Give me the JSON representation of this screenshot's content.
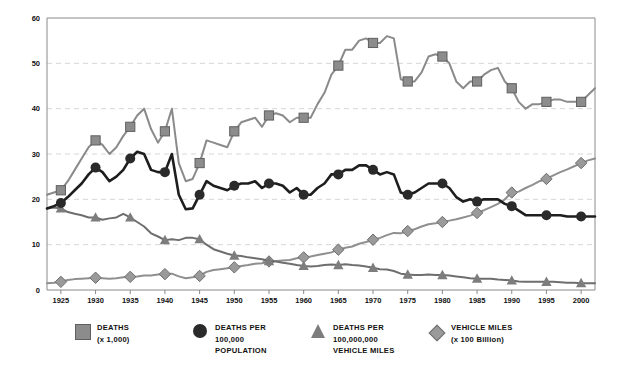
{
  "chart_data": {
    "type": "line",
    "title": "",
    "subtitle": "",
    "xlabel": "",
    "ylabel": "",
    "xlim": [
      1923,
      2002
    ],
    "ylim": [
      0,
      60
    ],
    "yticks": [
      0,
      10,
      20,
      30,
      40,
      50,
      60
    ],
    "xticks": [
      1925,
      1930,
      1935,
      1940,
      1945,
      1950,
      1955,
      1960,
      1965,
      1970,
      1975,
      1980,
      1985,
      1990,
      1995,
      2000
    ],
    "grid": "horizontal-dashed",
    "legend_position": "bottom",
    "x": [
      1923,
      1924,
      1925,
      1926,
      1927,
      1928,
      1929,
      1930,
      1931,
      1932,
      1933,
      1934,
      1935,
      1936,
      1937,
      1938,
      1939,
      1940,
      1941,
      1942,
      1943,
      1944,
      1945,
      1946,
      1947,
      1948,
      1949,
      1950,
      1951,
      1952,
      1953,
      1954,
      1955,
      1956,
      1957,
      1958,
      1959,
      1960,
      1961,
      1962,
      1963,
      1964,
      1965,
      1966,
      1967,
      1968,
      1969,
      1970,
      1971,
      1972,
      1973,
      1974,
      1975,
      1976,
      1977,
      1978,
      1979,
      1980,
      1981,
      1982,
      1983,
      1984,
      1985,
      1986,
      1987,
      1988,
      1989,
      1990,
      1991,
      1992,
      1993,
      1994,
      1995,
      1996,
      1997,
      1998,
      1999,
      2000,
      2001,
      2002
    ],
    "series": [
      {
        "name": "DEATHS (x 1,000)",
        "marker": "square",
        "color": "#8c8c8c",
        "line_color": "#8a8a8a",
        "marker_years": [
          1925,
          1930,
          1935,
          1940,
          1945,
          1950,
          1955,
          1960,
          1965,
          1970,
          1975,
          1980,
          1985,
          1990,
          1995,
          2000
        ],
        "values": [
          21.0,
          21.5,
          22.0,
          24.0,
          26.5,
          29.0,
          31.5,
          33.0,
          32.0,
          30.0,
          31.5,
          34.0,
          36.0,
          38.5,
          40.0,
          35.5,
          32.5,
          35.0,
          40.0,
          28.0,
          24.0,
          24.5,
          28.0,
          33.0,
          32.5,
          32.0,
          31.5,
          35.0,
          37.0,
          37.5,
          38.0,
          36.0,
          38.5,
          39.0,
          38.5,
          37.0,
          38.0,
          38.0,
          38.0,
          41.0,
          43.5,
          47.5,
          49.5,
          53.0,
          53.0,
          55.0,
          55.5,
          54.5,
          54.5,
          56.0,
          55.5,
          46.5,
          46.0,
          46.0,
          48.0,
          51.5,
          52.0,
          51.5,
          50.0,
          46.0,
          44.5,
          46.0,
          46.0,
          47.5,
          48.5,
          49.0,
          46.0,
          44.5,
          41.5,
          40.0,
          41.0,
          41.0,
          41.5,
          42.0,
          42.0,
          41.5,
          41.5,
          41.5,
          43.0,
          44.5
        ]
      },
      {
        "name": "DEATHS PER 100,000 POPULATION",
        "marker": "circle",
        "color": "#2a2a2a",
        "line_color": "#1e1e1e",
        "marker_years": [
          1925,
          1930,
          1935,
          1940,
          1945,
          1950,
          1955,
          1960,
          1965,
          1970,
          1975,
          1980,
          1985,
          1990,
          1995,
          2000
        ],
        "values": [
          18.0,
          18.5,
          19.2,
          20.5,
          22.0,
          23.5,
          25.5,
          27.0,
          26.0,
          24.0,
          25.0,
          26.5,
          29.0,
          30.5,
          30.0,
          26.5,
          26.0,
          26.0,
          30.0,
          21.0,
          17.8,
          18.0,
          21.0,
          24.0,
          23.0,
          22.5,
          22.0,
          23.0,
          23.5,
          23.5,
          24.0,
          22.5,
          23.5,
          23.5,
          23.0,
          21.5,
          22.5,
          21.0,
          21.0,
          22.5,
          23.5,
          25.5,
          25.5,
          26.5,
          26.5,
          27.5,
          27.5,
          26.5,
          25.5,
          26.0,
          25.5,
          21.5,
          21.0,
          21.5,
          22.5,
          23.5,
          23.5,
          23.5,
          22.5,
          20.5,
          19.5,
          20.0,
          19.5,
          20.0,
          20.0,
          20.0,
          19.0,
          18.5,
          17.5,
          16.5,
          16.5,
          16.5,
          16.5,
          16.5,
          16.5,
          16.2,
          16.2,
          16.2,
          16.2,
          16.2
        ]
      },
      {
        "name": "DEATHS PER 100,000,000 VEHICLE MILES",
        "marker": "triangle",
        "color": "#7d7d7d",
        "line_color": "#6e6e6e",
        "marker_years": [
          1925,
          1930,
          1935,
          1940,
          1945,
          1950,
          1955,
          1960,
          1965,
          1970,
          1975,
          1980,
          1985,
          1990,
          1995,
          2000
        ],
        "values": [
          18.0,
          18.2,
          18.0,
          17.2,
          16.8,
          16.5,
          16.0,
          16.0,
          15.5,
          15.8,
          16.0,
          16.8,
          16.0,
          15.0,
          14.0,
          12.5,
          11.8,
          11.0,
          11.2,
          11.0,
          11.5,
          11.5,
          11.2,
          10.0,
          9.0,
          8.5,
          8.0,
          7.6,
          7.5,
          7.2,
          7.0,
          6.8,
          6.4,
          6.3,
          6.0,
          5.8,
          5.5,
          5.3,
          5.2,
          5.3,
          5.5,
          5.6,
          5.5,
          5.7,
          5.5,
          5.4,
          5.2,
          4.9,
          4.6,
          4.5,
          4.2,
          3.6,
          3.4,
          3.3,
          3.3,
          3.4,
          3.3,
          3.3,
          3.2,
          3.0,
          2.8,
          2.6,
          2.5,
          2.5,
          2.5,
          2.3,
          2.2,
          2.1,
          1.9,
          1.8,
          1.8,
          1.8,
          1.8,
          1.8,
          1.7,
          1.6,
          1.6,
          1.5,
          1.5,
          1.5
        ]
      },
      {
        "name": "VEHICLE MILES (x 100 Billion)",
        "marker": "diamond",
        "color": "#9a9a9a",
        "line_color": "#8f8f8f",
        "marker_years": [
          1925,
          1930,
          1935,
          1940,
          1945,
          1950,
          1955,
          1960,
          1965,
          1970,
          1975,
          1980,
          1985,
          1990,
          1995,
          2000
        ],
        "values": [
          1.5,
          1.6,
          1.8,
          2.2,
          2.4,
          2.5,
          2.6,
          2.7,
          2.6,
          2.5,
          2.6,
          2.8,
          2.9,
          3.0,
          3.2,
          3.2,
          3.4,
          3.5,
          3.6,
          3.0,
          2.6,
          2.8,
          3.1,
          4.0,
          4.4,
          4.6,
          4.8,
          5.0,
          5.3,
          5.5,
          5.8,
          5.9,
          6.3,
          6.4,
          6.5,
          6.6,
          7.0,
          7.2,
          7.4,
          7.7,
          8.0,
          8.3,
          8.9,
          9.3,
          9.6,
          10.2,
          10.6,
          11.1,
          11.5,
          12.1,
          12.6,
          12.5,
          13.0,
          13.4,
          14.0,
          14.5,
          14.7,
          15.0,
          15.3,
          15.6,
          16.0,
          16.4,
          17.0,
          17.6,
          18.3,
          19.0,
          20.0,
          21.5,
          21.7,
          22.5,
          23.2,
          24.0,
          24.5,
          25.3,
          26.0,
          26.6,
          27.3,
          28.0,
          28.6,
          29.0
        ]
      }
    ]
  },
  "legend": {
    "items": [
      {
        "icon": "square-marker-icon",
        "line1": "DEATHS",
        "line2": "(x 1,000)",
        "line3": ""
      },
      {
        "icon": "circle-marker-icon",
        "line1": "DEATHS PER",
        "line2": "100,000",
        "line3": "POPULATION"
      },
      {
        "icon": "triangle-marker-icon",
        "line1": "DEATHS PER",
        "line2": "100,000,000",
        "line3": "VEHICLE MILES"
      },
      {
        "icon": "diamond-marker-icon",
        "line1": "VEHICLE MILES",
        "line2": "(x 100 Billion)",
        "line3": ""
      }
    ]
  },
  "colors": {
    "deaths": "#8c8c8c",
    "deaths_per_pop": "#2a2a2a",
    "deaths_per_miles": "#7d7d7d",
    "vehicle_miles": "#9a9a9a",
    "grid": "#d6d6d6",
    "axis": "#8a8a8a",
    "background": "#ffffff"
  }
}
